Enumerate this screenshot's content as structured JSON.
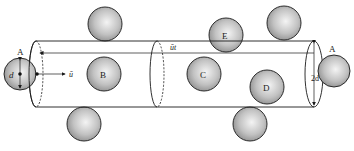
{
  "diagram": {
    "colors": {
      "line": "#1a1a1a",
      "sphere_light": "#f2f2f2",
      "sphere_mid": "#bdbdbd",
      "sphere_dark": "#8a8a8a",
      "background": "#ffffff"
    },
    "cylinder": {
      "left_x": 36,
      "right_x": 314,
      "mid_x": 157,
      "top_y": 41,
      "bottom_y": 107,
      "inner_y": 53,
      "ellipse_rx": 6
    },
    "spheres": [
      {
        "id": "A-left",
        "label": "A",
        "cx": 20,
        "cy": 74,
        "r": 16
      },
      {
        "id": "top-left",
        "label": "",
        "cx": 105,
        "cy": 24,
        "r": 17
      },
      {
        "id": "B",
        "label": "B",
        "cx": 104,
        "cy": 74,
        "r": 17
      },
      {
        "id": "bottom-left",
        "label": "",
        "cx": 84,
        "cy": 124,
        "r": 17
      },
      {
        "id": "E",
        "label": "E",
        "cx": 226,
        "cy": 35,
        "r": 17
      },
      {
        "id": "C",
        "label": "C",
        "cx": 204,
        "cy": 74,
        "r": 17
      },
      {
        "id": "top-right",
        "label": "",
        "cx": 284,
        "cy": 23,
        "r": 17
      },
      {
        "id": "D",
        "label": "D",
        "cx": 267,
        "cy": 87,
        "r": 17
      },
      {
        "id": "bottom-right",
        "label": "",
        "cx": 250,
        "cy": 124,
        "r": 17
      },
      {
        "id": "A-right",
        "label": "",
        "cx": 334,
        "cy": 71,
        "r": 16
      }
    ],
    "labels": {
      "a_left": "A",
      "a_right": "A",
      "d": "d",
      "two_d": "2d",
      "u": "ū",
      "ut": "ūt"
    }
  }
}
